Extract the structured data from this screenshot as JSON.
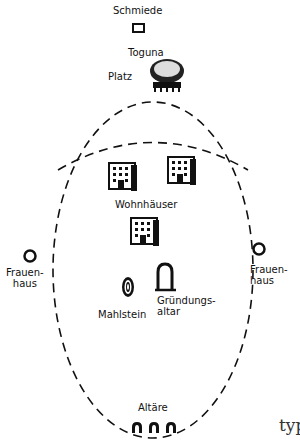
{
  "diagram": {
    "labels": {
      "smithy": "Schmiede",
      "toguna": "Toguna",
      "square": "Platz",
      "houses": "Wohnhäuser",
      "women_house_left": "Frauen-\nhaus",
      "women_house_right": "Frauen-\nhaus",
      "millstone": "Mahlstein",
      "founding_altar": "Gründungs-\naltar",
      "altars": "Altäre"
    },
    "cutoff_text": "typ",
    "elements": [
      {
        "name": "smithy",
        "shape": "square"
      },
      {
        "name": "toguna",
        "shape": "tree-shelter"
      },
      {
        "name": "dwelling-houses",
        "shape": "building",
        "count": 3
      },
      {
        "name": "women-house",
        "shape": "ring",
        "count": 2
      },
      {
        "name": "millstone",
        "shape": "double-ring"
      },
      {
        "name": "founding-altar",
        "shape": "arch"
      },
      {
        "name": "altars",
        "shape": "arch",
        "count": 3
      }
    ]
  }
}
